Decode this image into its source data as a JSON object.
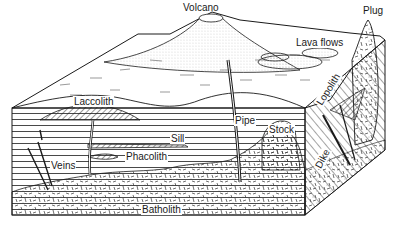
{
  "diagram": {
    "labels": {
      "volcano": "Volcano",
      "plug": "Plug",
      "lava_flows": "Lava flows",
      "laccolith": "Laccolith",
      "lopolith": "Lopolith",
      "sill": "Sill",
      "pipe": "Pipe",
      "stock": "Stock",
      "dike": "Dike",
      "veins": "Veins",
      "phacolith": "Phacolith",
      "batholith": "Batholith"
    },
    "colors": {
      "ink": "#1a1a1a",
      "paper": "#ffffff"
    }
  }
}
